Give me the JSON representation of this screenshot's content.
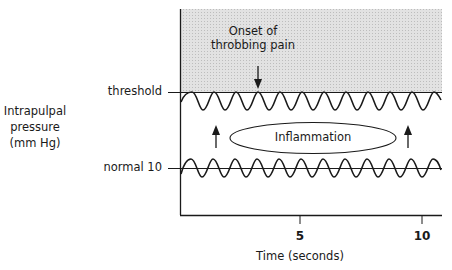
{
  "diagram": {
    "y_axis_label_lines": [
      "Intrapulpal",
      "pressure",
      "(mm Hg)"
    ],
    "levels": {
      "threshold_label": "threshold",
      "normal_label": "normal 10"
    },
    "annotation": {
      "onset_lines": [
        "Onset of",
        "throbbing pain"
      ]
    },
    "center_label": "Inflammation",
    "x_axis": {
      "label": "Time (seconds)",
      "ticks": [
        {
          "value": "5",
          "x": 300
        },
        {
          "value": "10",
          "x": 422
        }
      ]
    },
    "colors": {
      "shade": "#d9d9d9",
      "line": "#1a1a1a"
    }
  }
}
